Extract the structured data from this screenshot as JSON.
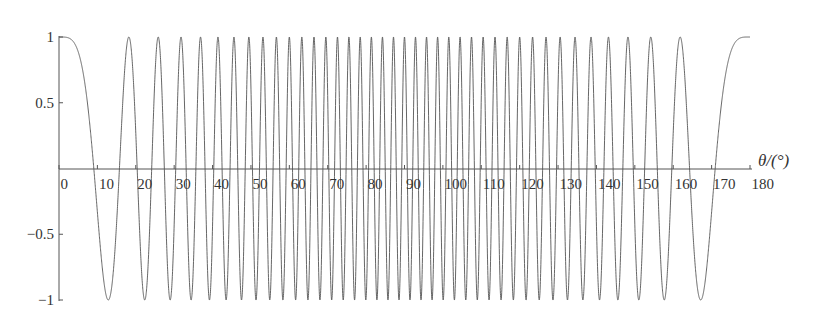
{
  "chart_data": {
    "type": "line",
    "title": "",
    "xlabel": "θ/(°)",
    "ylabel": "",
    "function": "cos(40π·cos θ)",
    "xlim": [
      0,
      180
    ],
    "ylim": [
      -1,
      1
    ],
    "x_ticks": [
      0,
      10,
      20,
      30,
      40,
      50,
      60,
      70,
      80,
      90,
      100,
      110,
      120,
      130,
      140,
      150,
      160,
      170,
      180
    ],
    "x_tick_labels": [
      "0",
      "10",
      "20",
      "30",
      "40",
      "50",
      "60",
      "70",
      "80",
      "90",
      "100",
      "110",
      "120",
      "130",
      "140",
      "150",
      "160",
      "170",
      "180"
    ],
    "y_ticks": [
      1,
      0.5,
      -0.5,
      -1
    ],
    "y_tick_labels": [
      "1",
      "0.5",
      "−0.5",
      "−1"
    ],
    "grid": false,
    "legend": null,
    "series": [
      {
        "name": "cos(40π cos θ)",
        "color": "#555555",
        "x": [
          0,
          5,
          10,
          12.8,
          15,
          18.2,
          20,
          22.3,
          25.8,
          28.9,
          31.8,
          34.4,
          36.9,
          39.2,
          41.4,
          45,
          50,
          60,
          70,
          80,
          90,
          100,
          110,
          120,
          130,
          135,
          138.6,
          143.1,
          148.2,
          154.2,
          161.8,
          167.2,
          170,
          175,
          180
        ],
        "y": [
          1,
          0.55,
          -0.63,
          -1,
          -0.37,
          1,
          0.55,
          -1,
          1,
          -1,
          1,
          -1,
          1,
          -1,
          1,
          -0.98,
          -0.35,
          1,
          -0.66,
          0.46,
          1,
          0.46,
          -0.66,
          1,
          -0.35,
          -0.98,
          1,
          1,
          1,
          1,
          1,
          -1,
          -0.63,
          0.55,
          1
        ]
      }
    ]
  },
  "axes": {
    "x_axis_label": "θ/(°)"
  }
}
